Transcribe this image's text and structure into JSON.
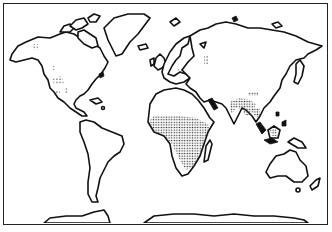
{
  "map": {
    "type": "world-outline-map",
    "style": "black-and-white line drawing",
    "projection": "equirectangular-like",
    "frame": true,
    "shading": "stippled dots",
    "colors": {
      "land_fill": "#ffffff",
      "outline": "#111111",
      "stipple": "#333333",
      "background": "#ffffff"
    },
    "stippled_regions": [
      {
        "name": "Sub-Saharan Africa",
        "density": "heavy"
      },
      {
        "name": "Indian subcontinent (northern/eastern India)",
        "density": "heavy"
      },
      {
        "name": "Southern China / Indochina",
        "density": "medium"
      },
      {
        "name": "Borneo",
        "density": "medium"
      },
      {
        "name": "Western North America (scattered patches)",
        "density": "light"
      },
      {
        "name": "Alaska / NW Canada (small patch)",
        "density": "light"
      },
      {
        "name": "Eastern Europe / Ukraine (small patch)",
        "density": "light"
      },
      {
        "name": "Western Siberia (small patch)",
        "density": "light"
      }
    ],
    "landmasses": [
      "North America",
      "Greenland",
      "South America",
      "Europe",
      "Asia",
      "Africa",
      "Australia",
      "Antarctica",
      "Madagascar",
      "Japan",
      "New Zealand",
      "Indonesia"
    ]
  }
}
